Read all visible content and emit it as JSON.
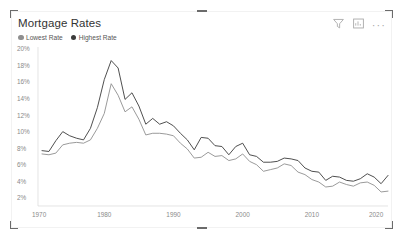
{
  "visual": {
    "title": "Mortgage Rates",
    "header_icons": [
      {
        "name": "filter-icon",
        "label": "Filters"
      },
      {
        "name": "focus-mode-icon",
        "label": "Focus mode"
      },
      {
        "name": "more-options-icon",
        "label": "More options"
      }
    ],
    "more_options_glyph": "···"
  },
  "legend": {
    "position": "top-left",
    "items": [
      {
        "label": "Lowest Rate",
        "color": "#8f8f8f"
      },
      {
        "label": "Highest Rate",
        "color": "#3b3b3b"
      }
    ]
  },
  "chart_data": {
    "type": "line",
    "title": "Mortgage Rates",
    "xlabel": "",
    "ylabel": "",
    "grid": false,
    "legend_position": "top-left",
    "y_tick_labels": [
      "20%",
      "18%",
      "16%",
      "14%",
      "12%",
      "10%",
      "8%",
      "6%",
      "4%",
      "2%"
    ],
    "y_tick_values": [
      20,
      18,
      16,
      14,
      12,
      10,
      8,
      6,
      4,
      2
    ],
    "ylim": [
      1,
      20
    ],
    "x_tick_labels": [
      "1970",
      "1980",
      "1990",
      "2000",
      "2010",
      "2020"
    ],
    "x_tick_values": [
      1970,
      1980,
      1990,
      2000,
      2010,
      2020
    ],
    "xlim": [
      1971,
      2021
    ],
    "x": [
      1971,
      1972,
      1973,
      1974,
      1975,
      1976,
      1977,
      1978,
      1979,
      1980,
      1981,
      1982,
      1983,
      1984,
      1985,
      1986,
      1987,
      1988,
      1989,
      1990,
      1991,
      1992,
      1993,
      1994,
      1995,
      1996,
      1997,
      1998,
      1999,
      2000,
      2001,
      2002,
      2003,
      2004,
      2005,
      2006,
      2007,
      2008,
      2009,
      2010,
      2011,
      2012,
      2013,
      2014,
      2015,
      2016,
      2017,
      2018,
      2019,
      2020,
      2021
    ],
    "series": [
      {
        "name": "Highest Rate",
        "color": "#3b3b3b",
        "values": [
          7.7,
          7.6,
          8.9,
          10.0,
          9.5,
          9.2,
          9.0,
          10.4,
          12.9,
          16.3,
          18.6,
          17.7,
          13.9,
          14.7,
          13.1,
          10.9,
          11.6,
          10.9,
          11.2,
          10.7,
          9.8,
          9.0,
          7.8,
          9.3,
          9.2,
          8.3,
          8.2,
          7.2,
          8.2,
          8.6,
          7.2,
          7.0,
          6.3,
          6.3,
          6.4,
          6.8,
          6.7,
          6.5,
          5.6,
          5.2,
          5.1,
          4.1,
          4.6,
          4.5,
          4.1,
          4.0,
          4.3,
          4.9,
          4.5,
          3.7,
          4.7
        ]
      },
      {
        "name": "Lowest Rate",
        "color": "#8f8f8f",
        "values": [
          7.3,
          7.2,
          7.4,
          8.4,
          8.6,
          8.7,
          8.6,
          9.0,
          10.4,
          12.2,
          15.8,
          14.4,
          12.4,
          13.0,
          11.5,
          9.6,
          9.8,
          9.8,
          9.7,
          9.5,
          8.6,
          7.9,
          6.8,
          6.9,
          7.5,
          7.0,
          7.1,
          6.5,
          6.7,
          7.3,
          6.4,
          6.0,
          5.2,
          5.4,
          5.6,
          6.1,
          5.9,
          5.1,
          4.8,
          4.2,
          3.9,
          3.3,
          3.4,
          3.9,
          3.6,
          3.4,
          3.8,
          3.9,
          3.5,
          2.7,
          2.8
        ]
      }
    ]
  }
}
